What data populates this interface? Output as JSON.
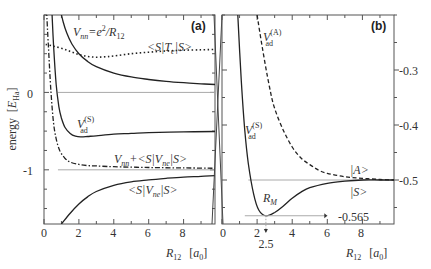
{
  "chart_data": [
    {
      "panel": "a",
      "type": "line",
      "panel_label": "(a)",
      "xlabel": "R12 [a0]",
      "ylabel": "energy [E_Ha]",
      "xlim": [
        0,
        9.8
      ],
      "ylim": [
        -1.7,
        1.0
      ],
      "xticks": [
        0,
        2,
        4,
        6,
        8
      ],
      "yticks": [
        0,
        -1
      ],
      "reference_lines": [
        0,
        -1
      ],
      "series": [
        {
          "name": "V_nn = e^2/R12",
          "style": "solid",
          "x": [
            0.95,
            1.1,
            1.3,
            1.6,
            2,
            2.5,
            3,
            4,
            5,
            6,
            7,
            8,
            9,
            9.8
          ],
          "y": [
            1.05,
            0.91,
            0.77,
            0.625,
            0.5,
            0.4,
            0.333,
            0.25,
            0.2,
            0.167,
            0.143,
            0.125,
            0.111,
            0.102
          ]
        },
        {
          "name": "<S|T_e|S>",
          "style": "dotted",
          "x": [
            0.1,
            0.5,
            1,
            1.5,
            2,
            2.5,
            3,
            3.5,
            4,
            5,
            6,
            7,
            8,
            9,
            9.8
          ],
          "y": [
            0.62,
            0.6,
            0.57,
            0.53,
            0.49,
            0.465,
            0.455,
            0.46,
            0.47,
            0.5,
            0.52,
            0.535,
            0.545,
            0.55,
            0.555
          ]
        },
        {
          "name": "V_ad^(S)",
          "style": "solid",
          "x": [
            0.45,
            0.55,
            0.7,
            0.85,
            1,
            1.2,
            1.5,
            1.8,
            2.1,
            2.5,
            3,
            4,
            5,
            6,
            8,
            9.8
          ],
          "y": [
            1.05,
            0.6,
            0.1,
            -0.18,
            -0.33,
            -0.45,
            -0.53,
            -0.565,
            -0.575,
            -0.57,
            -0.56,
            -0.54,
            -0.53,
            -0.52,
            -0.51,
            -0.505
          ]
        },
        {
          "name": "V_nn + <S|V_ne|S>",
          "style": "dashdot",
          "x": [
            0.15,
            0.25,
            0.4,
            0.55,
            0.7,
            0.9,
            1.2,
            1.5,
            2,
            2.5,
            3,
            4,
            6,
            8,
            9.8
          ],
          "y": [
            1.05,
            0.6,
            0.0,
            -0.4,
            -0.6,
            -0.75,
            -0.85,
            -0.9,
            -0.93,
            -0.945,
            -0.95,
            -0.96,
            -0.97,
            -0.975,
            -0.98
          ]
        },
        {
          "name": "<S|V_ne|S>",
          "style": "solid",
          "x": [
            1.0,
            1.5,
            2,
            2.5,
            3,
            4,
            5,
            6,
            7,
            8,
            9,
            9.8
          ],
          "y": [
            -1.7,
            -1.56,
            -1.44,
            -1.35,
            -1.28,
            -1.2,
            -1.155,
            -1.13,
            -1.11,
            -1.095,
            -1.085,
            -1.075
          ]
        }
      ],
      "annotations": [
        {
          "text": "V_nn = e^2/R_12"
        },
        {
          "text": "<S|T_e|S>"
        },
        {
          "text": "V_ad^(S)"
        },
        {
          "text": "V_nn + <S|V_ne|S>"
        },
        {
          "text": "<S|V_ne|S>"
        }
      ]
    },
    {
      "panel": "b",
      "type": "line",
      "panel_label": "(b)",
      "xlabel": "R12 [a0]",
      "ylabel": "",
      "xlim": [
        0,
        9.8
      ],
      "ylim": [
        -0.58,
        -0.2
      ],
      "xticks": [
        0,
        2,
        4,
        6,
        8
      ],
      "yticks": [
        -0.3,
        -0.4,
        -0.5
      ],
      "yaxis_side": "right",
      "reference_lines": [
        -0.5
      ],
      "series": [
        {
          "name": "V_ad^(S) |S>",
          "style": "solid",
          "x": [
            0.9,
            1.1,
            1.3,
            1.5,
            1.8,
            2.1,
            2.5,
            3,
            3.5,
            4,
            4.5,
            5,
            6,
            7,
            8,
            9,
            9.8
          ],
          "y": [
            -0.2,
            -0.32,
            -0.41,
            -0.47,
            -0.525,
            -0.555,
            -0.565,
            -0.559,
            -0.547,
            -0.533,
            -0.522,
            -0.514,
            -0.506,
            -0.502,
            -0.5,
            -0.5,
            -0.5
          ]
        },
        {
          "name": "V_ad^(A) |A>",
          "style": "dashed",
          "x": [
            2.0,
            2.3,
            2.7,
            3,
            3.5,
            4,
            4.5,
            5,
            5.5,
            6,
            7,
            8,
            9,
            9.8
          ],
          "y": [
            -0.2,
            -0.26,
            -0.33,
            -0.37,
            -0.41,
            -0.44,
            -0.46,
            -0.472,
            -0.482,
            -0.488,
            -0.494,
            -0.497,
            -0.499,
            -0.5
          ]
        }
      ],
      "annotations": [
        {
          "text": "V_ad^(A)"
        },
        {
          "text": "V_ad^(S)"
        },
        {
          "text": "|A>"
        },
        {
          "text": "|S>"
        },
        {
          "text": "R_M"
        },
        {
          "text": "-0.565",
          "y": -0.565
        },
        {
          "text": "2.5",
          "x": 2.5
        }
      ]
    }
  ],
  "labels": {
    "panel_a": "(a)",
    "panel_b": "(b)",
    "ylabel_word": "energy",
    "ylabel_unit_open": "[",
    "ylabel_unit_E": "E",
    "ylabel_unit_sub": "Ha",
    "ylabel_unit_close": "]",
    "xlabel_R": "R",
    "xlabel_sub": "12",
    "xlabel_unit_open": "[",
    "xlabel_unit_a": "a",
    "xlabel_unit_sub": "0",
    "xlabel_unit_close": "]",
    "vnn_V": "V",
    "vnn_sub": "nn",
    "vnn_eq": "=e",
    "vnn_sup": "2",
    "vnn_over": "/R",
    "vnn_sub2": "12",
    "ste_open": "<S|T",
    "ste_sub": "e",
    "ste_close": "|S>",
    "vad_V": "V",
    "vad_sup_S": "(S)",
    "vad_sub": "ad",
    "vad_sup_A": "(A)",
    "sum_V": "V",
    "sum_sub": "nn",
    "sum_mid": "+<S|V",
    "sum_sub2": "ne",
    "sum_close": "|S>",
    "vne_open": "<S|V",
    "vne_sub": "ne",
    "vne_close": "|S>",
    "ket_A": "|A>",
    "ket_S": "|S>",
    "rm_R": "R",
    "rm_sub": "M",
    "min_value": "-0.565",
    "min_R": "2.5",
    "a_xtick_0": "0",
    "a_xtick_2": "2",
    "a_xtick_4": "4",
    "a_xtick_6": "6",
    "a_xtick_8": "8",
    "a_ytick_0": "0",
    "a_ytick_m1": "-1",
    "b_xtick_0": "0",
    "b_xtick_2": "2",
    "b_xtick_4": "4",
    "b_xtick_6": "6",
    "b_xtick_8": "8",
    "b_ytick_03": "-0.3",
    "b_ytick_04": "-0.4",
    "b_ytick_05": "-0.5"
  },
  "colors": {
    "axis": "#555555",
    "curve": "#222222",
    "reference_line": "#aaaaaa"
  }
}
